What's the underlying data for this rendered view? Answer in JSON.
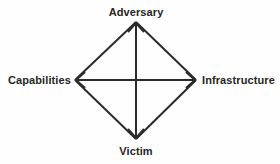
{
  "diagram": {
    "name": "diamond-model-of-intrusion-analysis",
    "type": "diamond",
    "stroke_color": "#2b2b2b",
    "background_color": "#fefefe",
    "stroke_width": 2,
    "nodes": [
      {
        "id": "adversary",
        "label": "Adversary",
        "position": "top"
      },
      {
        "id": "capabilities",
        "label": "Capabilities",
        "position": "left"
      },
      {
        "id": "infrastructure",
        "label": "Infrastructure",
        "position": "right"
      },
      {
        "id": "victim",
        "label": "Victim",
        "position": "bottom"
      }
    ],
    "edges": [
      {
        "from": "capabilities",
        "to": "adversary",
        "style": "plain"
      },
      {
        "from": "adversary",
        "to": "infrastructure",
        "style": "plain"
      },
      {
        "from": "infrastructure",
        "to": "victim",
        "style": "plain"
      },
      {
        "from": "victim",
        "to": "capabilities",
        "style": "plain"
      },
      {
        "from": "capabilities",
        "to": "infrastructure",
        "style": "double-arrow",
        "axis": "horizontal"
      },
      {
        "from": "victim",
        "to": "adversary",
        "style": "double-arrow",
        "axis": "vertical"
      }
    ]
  }
}
